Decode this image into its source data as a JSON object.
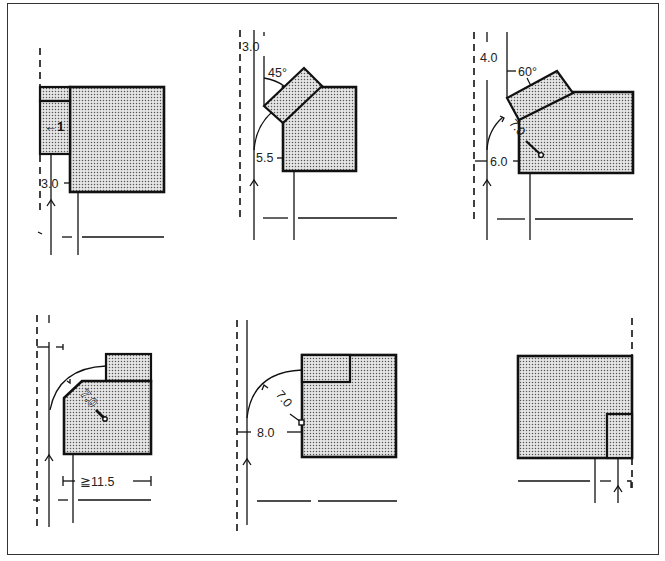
{
  "figure": {
    "panels": [
      {
        "id": "p1",
        "labels": {
          "dim": "3.0",
          "marker": "←1"
        }
      },
      {
        "id": "p2",
        "labels": {
          "offset": "3.0",
          "angle": "45°",
          "dim": "5.5"
        }
      },
      {
        "id": "p3",
        "labels": {
          "offset": "4.0",
          "angle": "60°",
          "radius": "7.0",
          "dim": "6.0"
        }
      },
      {
        "id": "p4",
        "labels": {
          "radius": "7.0",
          "width": "≧11.5"
        }
      },
      {
        "id": "p5",
        "labels": {
          "radius": "7.0",
          "dim": "8.0"
        }
      },
      {
        "id": "p6",
        "labels": {}
      }
    ],
    "colors": {
      "line": "#111111",
      "fill_dots": "#555555",
      "background": "#ffffff"
    }
  }
}
